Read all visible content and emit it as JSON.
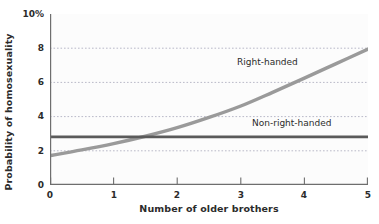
{
  "chart_data": {
    "type": "line",
    "title": "",
    "xlabel": "Number of older brothers",
    "ylabel": "Probability of homosexuality",
    "xlim": [
      0,
      5
    ],
    "ylim": [
      0,
      10
    ],
    "grid": true,
    "grid_orientation": "horizontal-dotted",
    "grid_values": [
      2,
      4,
      6,
      8
    ],
    "legend_position": "inline-annotation",
    "x_ticks": [
      "0",
      "1",
      "2",
      "3",
      "4",
      "5"
    ],
    "y_ticks": [
      "0",
      "2",
      "4",
      "6",
      "8",
      "10%"
    ],
    "y_tick_values": [
      0,
      2,
      4,
      6,
      8,
      10
    ],
    "x_tick_values": [
      0,
      1,
      2,
      3,
      4,
      5
    ],
    "y_unit": "%",
    "x": [
      0,
      0.5,
      1,
      1.5,
      2,
      2.5,
      3,
      3.5,
      4,
      4.5,
      5
    ],
    "series": [
      {
        "name": "Right-handed",
        "color": "#9a9a9a",
        "values": [
          1.72,
          2.05,
          2.42,
          2.85,
          3.35,
          3.95,
          4.62,
          5.42,
          6.25,
          7.1,
          7.95
        ]
      },
      {
        "name": "Non-right-handed",
        "color": "#5a5a5a",
        "values": [
          2.82,
          2.82,
          2.82,
          2.82,
          2.82,
          2.82,
          2.82,
          2.82,
          2.82,
          2.82,
          2.82
        ]
      }
    ],
    "annotations": [
      {
        "text": "Right-handed",
        "x": 3.0,
        "y": 6.6
      },
      {
        "text": "Non-right-handed",
        "x": 3.3,
        "y": 3.15
      }
    ]
  },
  "axes": {
    "y_title": "Probability of homosexuality",
    "x_title": "Number of older brothers",
    "y_labels": [
      "10%",
      "8",
      "6",
      "4",
      "2",
      "0"
    ],
    "x_labels": [
      "0",
      "1",
      "2",
      "3",
      "4",
      "5"
    ]
  },
  "labels": {
    "right_handed": "Right-handed",
    "non_right_handed": "Non-right-handed"
  },
  "colors": {
    "right_handed_line": "#9a9a9a",
    "non_right_handed_line": "#5a5a5a",
    "axis": "#6e6e6e",
    "gridline": "#b9b9c8",
    "text": "#2b2b2b",
    "plot_background": "#fcfcfc"
  }
}
